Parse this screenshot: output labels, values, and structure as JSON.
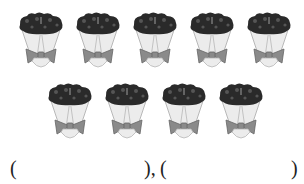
{
  "worksheet": {
    "top_text_cutoff": "",
    "rows": [
      {
        "count": 5,
        "positions": [
          17,
          74,
          131,
          188,
          245
        ]
      },
      {
        "count": 4,
        "positions": [
          46,
          103,
          160,
          217
        ]
      }
    ],
    "item": {
      "name": "flower bouquet",
      "total_count": 9,
      "colors": {
        "flowers": "#2a2a2a",
        "wrap": "#ececec",
        "wrap_outline": "#b8b8b8",
        "bow": "#8a8a8a",
        "bow_outline": "#666666"
      }
    },
    "answer": {
      "open_1": "(",
      "blank_1": "",
      "close_1_sep": "),",
      "open_2": "(",
      "blank_2": "",
      "close_2": ")"
    }
  }
}
